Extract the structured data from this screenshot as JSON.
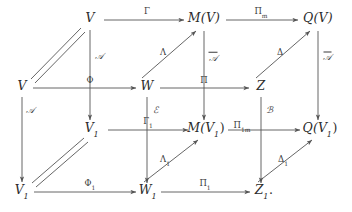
{
  "figure": {
    "kind": "commutative-diagram",
    "stroke_color": "#555555",
    "text_color": "#2b2b2b",
    "background": "#ffffff",
    "width": 352,
    "height": 212
  },
  "objects": [
    {
      "id": "V_top",
      "text": "V",
      "sub": "",
      "period": "",
      "x": 90,
      "y": 20
    },
    {
      "id": "MV",
      "text": "M(V)",
      "sub": "",
      "period": "",
      "x": 204,
      "y": 20
    },
    {
      "id": "QV",
      "text": "Q(V)",
      "sub": "",
      "period": "",
      "x": 318,
      "y": 20
    },
    {
      "id": "V_mid",
      "text": "V",
      "sub": "",
      "period": "",
      "x": 22,
      "y": 88
    },
    {
      "id": "W",
      "text": "W",
      "sub": "",
      "period": "",
      "x": 147,
      "y": 88
    },
    {
      "id": "Z",
      "text": "Z",
      "sub": "",
      "period": "",
      "x": 261,
      "y": 88
    },
    {
      "id": "V1_mid",
      "text": "V",
      "sub": "1",
      "period": "",
      "x": 92,
      "y": 130
    },
    {
      "id": "MV1",
      "text": "M(V",
      "sub": "1",
      "period": ")",
      "x": 206,
      "y": 130
    },
    {
      "id": "QV1",
      "text": "Q(V",
      "sub": "1",
      "period": ")",
      "x": 320,
      "y": 130
    },
    {
      "id": "V1_bot",
      "text": "V",
      "sub": "1",
      "period": "",
      "x": 22,
      "y": 192
    },
    {
      "id": "W1",
      "text": "W",
      "sub": "1",
      "period": "",
      "x": 148,
      "y": 192
    },
    {
      "id": "Z1",
      "text": "Z",
      "sub": "1",
      "period": ".",
      "x": 264,
      "y": 192
    }
  ],
  "arrows": [
    {
      "id": "Gamma",
      "label": "Γ",
      "sub": "",
      "style": "plain",
      "label_x": 147,
      "label_y": 12,
      "from": "V_top",
      "to": "MV"
    },
    {
      "id": "Pi_m",
      "label": "Π",
      "sub": "m",
      "style": "plain",
      "label_x": 261,
      "label_y": 12,
      "from": "MV",
      "to": "QV"
    },
    {
      "id": "Phi",
      "label": "Φ",
      "sub": "",
      "style": "plain",
      "label_x": 90,
      "label_y": 81,
      "from": "V_mid",
      "to": "W"
    },
    {
      "id": "Pi",
      "label": "Π",
      "sub": "",
      "style": "plain",
      "label_x": 204,
      "label_y": 81,
      "from": "W",
      "to": "Z"
    },
    {
      "id": "Gamma_1",
      "label": "Γ",
      "sub": "1",
      "style": "plain",
      "label_x": 148,
      "label_y": 122,
      "from": "V1_mid",
      "to": "MV1"
    },
    {
      "id": "Pi_1m",
      "label": "Π",
      "sub": "1m",
      "style": "plain",
      "label_x": 242,
      "label_y": 126,
      "from": "MV1",
      "to": "QV1"
    },
    {
      "id": "Phi_1",
      "label": "Φ",
      "sub": "1",
      "style": "plain",
      "label_x": 90,
      "label_y": 184,
      "from": "V1_bot",
      "to": "W1"
    },
    {
      "id": "Pi_1",
      "label": "Π",
      "sub": "1",
      "style": "plain",
      "label_x": 205,
      "label_y": 184,
      "from": "W1",
      "to": "Z1"
    },
    {
      "id": "A_top",
      "label": "𝒜",
      "sub": "",
      "style": "script",
      "label_x": 99,
      "label_y": 56,
      "from": "V_top",
      "to": "V1_mid"
    },
    {
      "id": "A_left",
      "label": "𝒜",
      "sub": "",
      "style": "script",
      "label_x": 30,
      "label_y": 110,
      "from": "V_mid",
      "to": "V1_bot"
    },
    {
      "id": "Abar",
      "label": "𝒜",
      "sub": "",
      "style": "script-overbar",
      "label_x": 213,
      "label_y": 57,
      "from": "MV",
      "to": "MV1"
    },
    {
      "id": "Atilde",
      "label": "𝒜",
      "sub": "",
      "style": "script-tildebar",
      "label_x": 327,
      "label_y": 57,
      "from": "QV",
      "to": "QV1"
    },
    {
      "id": "E",
      "label": "ℰ",
      "sub": "",
      "style": "script",
      "label_x": 155,
      "label_y": 110,
      "from": "W",
      "to": "W1"
    },
    {
      "id": "B",
      "label": "ℬ",
      "sub": "",
      "style": "script",
      "label_x": 269,
      "label_y": 110,
      "from": "Z",
      "to": "Z1"
    },
    {
      "id": "Lambda",
      "label": "Λ",
      "sub": "",
      "style": "plain",
      "label_x": 163,
      "label_y": 53,
      "from": "W",
      "to": "MV"
    },
    {
      "id": "Delta",
      "label": "Δ",
      "sub": "",
      "style": "plain",
      "label_x": 280,
      "label_y": 53,
      "from": "Z",
      "to": "QV"
    },
    {
      "id": "Lambda_1",
      "label": "Λ",
      "sub": "1",
      "style": "plain",
      "label_x": 165,
      "label_y": 160,
      "from": "W1",
      "to": "MV1"
    },
    {
      "id": "Delta_1",
      "label": "Δ",
      "sub": "1",
      "style": "plain",
      "label_x": 283,
      "label_y": 160,
      "from": "Z1",
      "to": "QV1"
    }
  ],
  "equalities": [
    {
      "id": "V_equals_V",
      "from": "V_mid",
      "to": "V_top",
      "note": "double line identity"
    },
    {
      "id": "V1_equals_V1",
      "from": "V1_bot",
      "to": "V1_mid",
      "note": "double line identity"
    }
  ]
}
